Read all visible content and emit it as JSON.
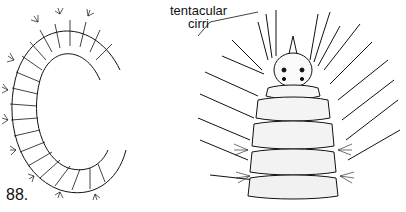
{
  "figure": {
    "number": "88.",
    "labels": {
      "tentacular_line1": "tentacular",
      "tentacular_line2": "cirri"
    },
    "panels": [
      {
        "name": "whole-worm-coiled",
        "description": "Coiled polychaete worm, lateral view with parapodia and setae"
      },
      {
        "name": "anterior-end-dorsal",
        "description": "Anterior end, dorsal view with prostomium, eyes and tentacular cirri"
      }
    ],
    "colors": {
      "ink": "#111111",
      "background": "#ffffff"
    }
  }
}
